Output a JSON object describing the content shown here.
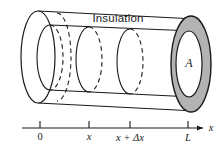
{
  "figure": {
    "title_label": "Insulation",
    "area_label": "A",
    "axis": {
      "name": "x",
      "ticks": [
        {
          "label": "0",
          "style": "plain",
          "px": 40
        },
        {
          "label": "x",
          "style": "italic",
          "px": 89
        },
        {
          "label": "x + Δx",
          "style": "italic",
          "px": 130
        },
        {
          "label": "L",
          "style": "italic",
          "px": 188
        }
      ],
      "line_start_px": 22,
      "line_end_px": 203,
      "line_y_px": 128
    },
    "colors": {
      "stroke": "#1a1a1a",
      "annulus_fill": "#b3b3b3",
      "background": "#ffffff",
      "inner_face_fill": "#ffffff"
    },
    "icons": {
      "cylinder": "insulated-rod-cylinder",
      "cross_section": "cross-section-ellipse",
      "annulus": "end-cap-annulus",
      "axis_arrow": "axis-arrow-right"
    }
  }
}
